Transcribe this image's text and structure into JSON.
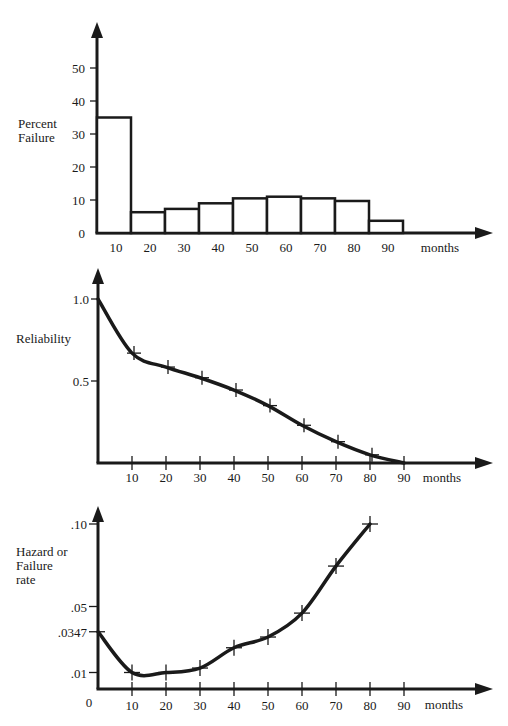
{
  "chart_data": [
    {
      "type": "bar",
      "title": "",
      "xlabel": "months",
      "ylabel": [
        "Percent",
        "Failure"
      ],
      "categories": [
        "10",
        "20",
        "30",
        "40",
        "50",
        "60",
        "70",
        "80",
        "90"
      ],
      "values": [
        35,
        6.3,
        7.3,
        9,
        10.5,
        11,
        10.5,
        9.7,
        3.7
      ],
      "yticks": [
        0,
        10,
        20,
        30,
        40,
        50
      ],
      "ylim": [
        0,
        55
      ],
      "grid": false
    },
    {
      "type": "line",
      "title": "",
      "xlabel": "months",
      "ylabel": [
        "Reliability"
      ],
      "x": [
        0,
        10,
        20,
        30,
        40,
        50,
        60,
        70,
        80,
        90
      ],
      "values": [
        1.0,
        0.67,
        0.585,
        0.52,
        0.445,
        0.35,
        0.23,
        0.13,
        0.05,
        0.0
      ],
      "markers": [
        10,
        20,
        30,
        40,
        50,
        60,
        70,
        80
      ],
      "xticks": [
        10,
        20,
        30,
        40,
        50,
        60,
        70,
        80,
        90
      ],
      "yticks": [
        {
          "value": 0.5,
          "label": "0.5"
        },
        {
          "value": 1.0,
          "label": "1.0"
        }
      ],
      "ylim": [
        0,
        1.1
      ],
      "grid": false
    },
    {
      "type": "line",
      "title": "",
      "xlabel": "months",
      "ylabel": [
        "Hazard or",
        "Failure",
        "rate"
      ],
      "x": [
        0,
        10,
        20,
        30,
        40,
        50,
        60,
        70,
        80
      ],
      "values": [
        0.0347,
        0.01,
        0.01,
        0.0127,
        0.025,
        0.0315,
        0.046,
        0.0745,
        0.1
      ],
      "markers": [
        0,
        10,
        20,
        30,
        40,
        50,
        60,
        70,
        80
      ],
      "xticks": [
        10,
        20,
        30,
        40,
        50,
        60,
        70,
        80,
        90
      ],
      "yticks": [
        {
          "value": 0,
          "label": "0"
        },
        {
          "value": 0.01,
          "label": ".01"
        },
        {
          "value": 0.0347,
          "label": ".0347"
        },
        {
          "value": 0.05,
          "label": ".05"
        },
        {
          "value": 0.1,
          "label": ".10"
        }
      ],
      "ylim": [
        0,
        0.11
      ],
      "grid": false
    }
  ]
}
